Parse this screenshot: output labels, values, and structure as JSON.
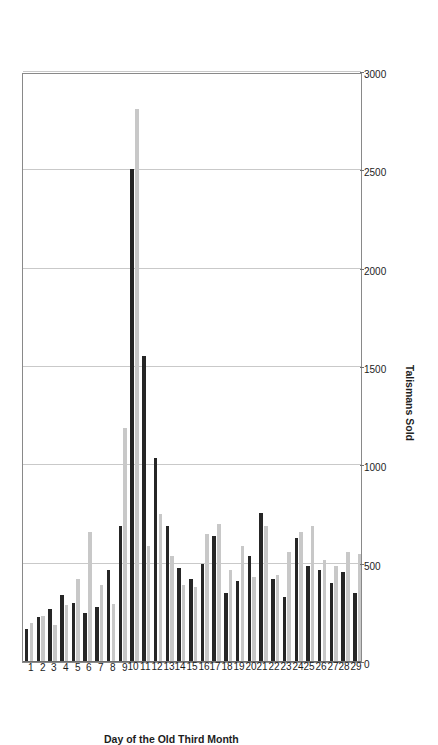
{
  "chart_data": {
    "type": "bar",
    "orientation": "horizontal-rotated",
    "title": "",
    "xlabel": "Day of the Old Third Month",
    "ylabel": "Talismans Sold",
    "ylim": [
      0,
      3000
    ],
    "ytick_values": [
      0,
      500,
      1000,
      1500,
      2000,
      2500,
      3000
    ],
    "ytick_labels": [
      "0",
      "500",
      "1000",
      "1500",
      "2000",
      "2500",
      "3000"
    ],
    "grid": true,
    "legend_position": "top-center",
    "categories": [
      "1",
      "2",
      "3",
      "4",
      "5",
      "6",
      "7",
      "8",
      "9",
      "10",
      "11",
      "12",
      "13",
      "14",
      "15",
      "16",
      "17",
      "18",
      "19",
      "20",
      "21",
      "22",
      "23",
      "24",
      "25",
      "26",
      "27",
      "28",
      "29"
    ],
    "series": [
      {
        "name": "1880",
        "color": "#c8c8c8",
        "values": [
          200,
          235,
          190,
          290,
          420,
          660,
          390,
          295,
          1190,
          2810,
          590,
          755,
          540,
          390,
          380,
          650,
          700,
          470,
          590,
          430,
          690,
          440,
          560,
          660,
          690,
          520,
          490,
          560,
          550
        ]
      },
      {
        "name": "1881",
        "color": "#262626",
        "values": [
          170,
          230,
          270,
          340,
          300,
          250,
          280,
          470,
          690,
          2505,
          1555,
          1035,
          690,
          480,
          420,
          500,
          640,
          350,
          410,
          540,
          760,
          420,
          330,
          630,
          490,
          470,
          400,
          460,
          350
        ]
      }
    ]
  },
  "legend": {
    "items": [
      {
        "label": "1880",
        "color": "#c8c8c8"
      },
      {
        "label": "1881",
        "color": "#262626"
      }
    ]
  },
  "axes": {
    "value_axis_title": "Talismans Sold",
    "category_axis_title": "Day of the Old Third Month"
  }
}
